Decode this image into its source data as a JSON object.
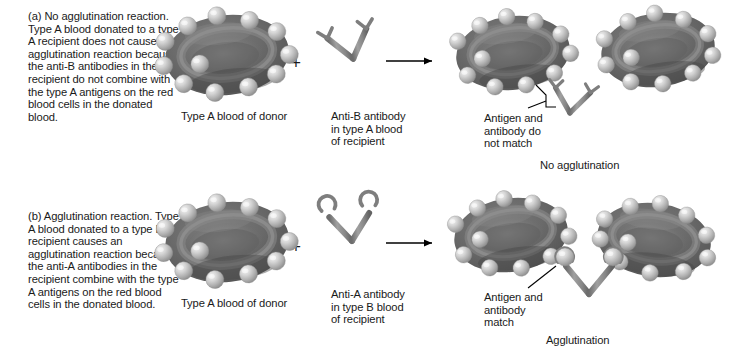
{
  "figure": {
    "colors": {
      "cell_body_dark": "#5d5d5d",
      "cell_body_mid": "#6f6f6f",
      "cell_rim_light": "#8e8e8e",
      "antigen_light": "#d8d8d8",
      "antigen_mid": "#b4b4b4",
      "antibody_gray": "#8a8a8a",
      "antibody_outline": "#555555",
      "text": "#1a1a1a",
      "arrow": "#000000",
      "background": "#ffffff"
    }
  },
  "panel_a": {
    "caption": "(a) No agglutination reaction. Type A blood donated to a type A recipient does not cause an agglutination reaction because the anti-B antibodies in the recipient do not combine with the type A antigens on the red blood cells in the donated blood.",
    "cell_label": "Type A blood of donor",
    "plus": "+",
    "antibody_label": "Anti-B antibody\nin type A blood\nof recipient",
    "arrow": "reaction-arrow",
    "mismatch_label": "Antigen and\nantibody do\nnot match",
    "result_label": "No agglutination"
  },
  "panel_b": {
    "caption": "(b) Agglutination reaction. Type A blood donated to a type B recipient causes an agglutination reaction because the anti-A antibodies in the recipient combine with the type A antigens on the red blood cells in the donated blood.",
    "cell_label": "Type A blood of donor",
    "plus": "+",
    "antibody_label": "Anti-A antibody\nin type B blood\nof recipient",
    "arrow": "reaction-arrow",
    "match_label": "Antigen and\nantibody\nmatch",
    "result_label": "Agglutination"
  }
}
